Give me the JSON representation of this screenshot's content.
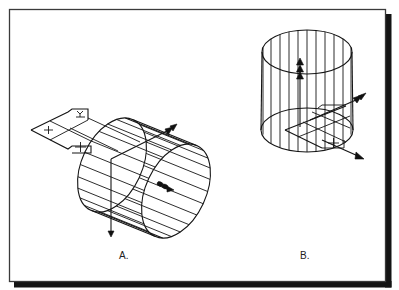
{
  "figure": {
    "colors": {
      "background": "#ffffff",
      "line": "#151515",
      "frame_border": "#3a3a3a",
      "frame_shadow": "#141414"
    },
    "panels": [
      {
        "id": "A",
        "label": "A."
      },
      {
        "id": "B",
        "label": "B."
      }
    ]
  }
}
